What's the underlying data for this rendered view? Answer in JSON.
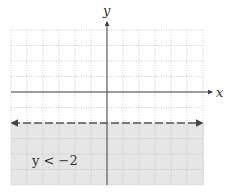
{
  "chart_data": {
    "type": "inequality-graph",
    "title": "",
    "xlabel": "x",
    "ylabel": "y",
    "grid": true,
    "xlim": [
      -6,
      6
    ],
    "ylim": [
      -6,
      4
    ],
    "boundary": {
      "equation": "y = -2",
      "style": "dashed",
      "y_value": -2
    },
    "shaded_region": "below",
    "inequality_label": "y < −2",
    "label_position": {
      "x": -4.7,
      "y": -4.5
    }
  },
  "graph": {
    "x_axis_label": "x",
    "y_axis_label": "y",
    "inequality_label": "y < −2"
  },
  "colors": {
    "background": "#ffffff",
    "shading": "#e6e6e6",
    "grid": "#bdbdbd",
    "axis": "#444444",
    "boundary": "#555555"
  }
}
